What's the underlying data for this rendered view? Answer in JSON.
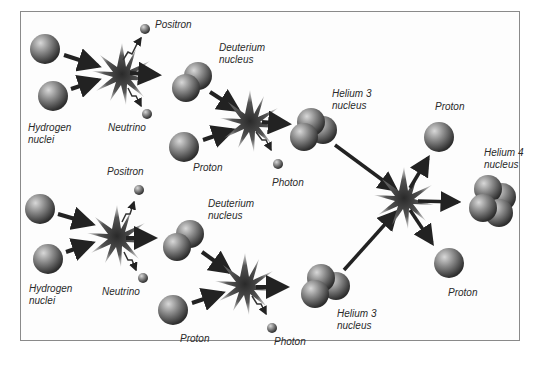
{
  "diagram": {
    "labels": {
      "hydrogen_top": "Hydrogen\nnuclei",
      "positron_top": "Positron",
      "neutrino_top": "Neutrino",
      "deuterium_top": "Deuterium\nnucleus",
      "proton_top": "Proton",
      "photon_top": "Photon",
      "helium3_top": "Helium 3\nnucleus",
      "proton_out_top": "Proton",
      "helium4": "Helium 4\nnucleus",
      "hydrogen_bottom": "Hydrogen\nnuclei",
      "positron_bottom": "Positron",
      "neutrino_bottom": "Neutrino",
      "deuterium_bottom": "Deuterium\nnucleus",
      "proton_bottom": "Proton",
      "photon_bottom": "Photon",
      "helium3_bottom": "Helium 3\nnucleus",
      "proton_out_bottom": "Proton"
    },
    "colors": {
      "particle": "#6e6e6e",
      "arrow": "#222222",
      "burst": "#3a3a3a",
      "frame": "#8a8a8a"
    }
  }
}
